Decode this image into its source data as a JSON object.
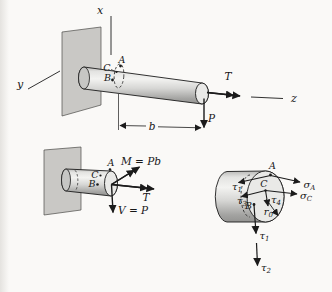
{
  "colors": {
    "background": "#faf9f7",
    "ink": "#1b1b1b",
    "wall_gray": "#c9c8c5",
    "shaft_light": "#f3f3f1",
    "shaft_dark": "#949492",
    "cut_face": "#e9e9e7"
  },
  "top_figure": {
    "axis_x": "x",
    "axis_y": "y",
    "axis_z": "z",
    "point_a": "A",
    "point_b": "B",
    "point_c": "C",
    "torque": "T",
    "load": "P",
    "span": "b"
  },
  "cut_figure": {
    "point_a": "A",
    "point_b": "B",
    "point_c": "C",
    "moment": "M = Pb",
    "torque": "T",
    "shear": "V = P"
  },
  "section_figure": {
    "point_a": "A",
    "point_b": "B",
    "point_c": "C",
    "sigma_a": {
      "base": "σ",
      "sub": "A"
    },
    "sigma_c": {
      "base": "σ",
      "sub": "C"
    },
    "tau_a": {
      "base": "τ",
      "sub": "1"
    },
    "tau_c_tangential": {
      "base": "τ",
      "sub": "3"
    },
    "tau_c_vertical": {
      "base": "τ",
      "sub": "4"
    },
    "tau_b_torsion": {
      "base": "τ",
      "sub": "1"
    },
    "tau_b_shear": {
      "base": "τ",
      "sub": "2"
    },
    "radius": {
      "base": "r",
      "sub": "0"
    }
  }
}
